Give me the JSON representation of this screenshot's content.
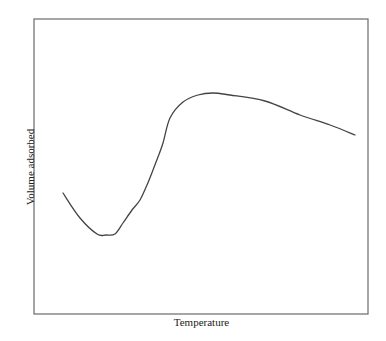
{
  "chart_data": {
    "type": "line",
    "title": "",
    "xlabel": "Temperature",
    "ylabel": "Volume adsorbed",
    "grid": false,
    "legend": null,
    "axis_ticks": false,
    "frame": {
      "left": 34,
      "top": 19,
      "right": 368,
      "bottom": 314
    },
    "series": [
      {
        "name": "Adsorption isobar",
        "color": "#444444",
        "points_px": [
          [
            63,
            193
          ],
          [
            80,
            218
          ],
          [
            97,
            234
          ],
          [
            106,
            235
          ],
          [
            115,
            234
          ],
          [
            123,
            223
          ],
          [
            132,
            210
          ],
          [
            140,
            200
          ],
          [
            147,
            185
          ],
          [
            153,
            170
          ],
          [
            158,
            157
          ],
          [
            163,
            143
          ],
          [
            170,
            118
          ],
          [
            183,
            102
          ],
          [
            198,
            95
          ],
          [
            213,
            93
          ],
          [
            230,
            95
          ],
          [
            265,
            101
          ],
          [
            300,
            115
          ],
          [
            330,
            125
          ],
          [
            355,
            135
          ]
        ]
      }
    ]
  },
  "labels": {
    "x": "Temperature",
    "y": "Volume adsorbed"
  },
  "colors": {
    "frame": "#6a6a6a",
    "line": "#444444"
  }
}
